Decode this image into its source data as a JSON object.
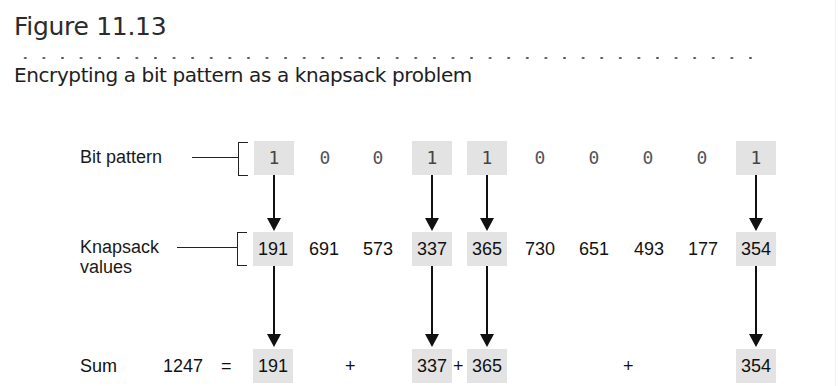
{
  "figure": {
    "number": "Figure 11.13",
    "caption": "Encrypting a bit pattern as a knapsack problem"
  },
  "labels": {
    "bit_pattern": "Bit pattern",
    "knapsack_line1": "Knapsack",
    "knapsack_line2": "values",
    "sum": "Sum"
  },
  "bits": [
    "1",
    "0",
    "0",
    "1",
    "1",
    "0",
    "0",
    "0",
    "0",
    "1"
  ],
  "knapsack_values": [
    "191",
    "691",
    "573",
    "337",
    "365",
    "730",
    "651",
    "493",
    "177",
    "354"
  ],
  "selected_indices": [
    0,
    3,
    4,
    9
  ],
  "sum": {
    "total": "1247",
    "equals": "=",
    "terms": [
      "191",
      "337",
      "365",
      "354"
    ],
    "plus": "+"
  },
  "colors": {
    "highlight": "#e3e3e3",
    "arrow": "#111111"
  }
}
